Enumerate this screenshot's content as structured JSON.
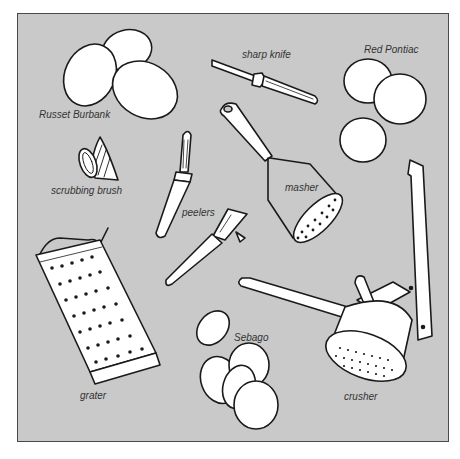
{
  "illustration": {
    "background_color": "#c9c9c9",
    "line_color": "#1a1a1a",
    "fill_color": "#ffffff",
    "labels": {
      "russet_burbank": "Russet Burbank",
      "sharp_knife": "sharp knife",
      "red_pontiac": "Red Pontiac",
      "scrubbing_brush": "scrubbing brush",
      "masher": "masher",
      "peelers": "peelers",
      "grater": "grater",
      "sebago": "Sebago",
      "crusher": "crusher"
    }
  }
}
